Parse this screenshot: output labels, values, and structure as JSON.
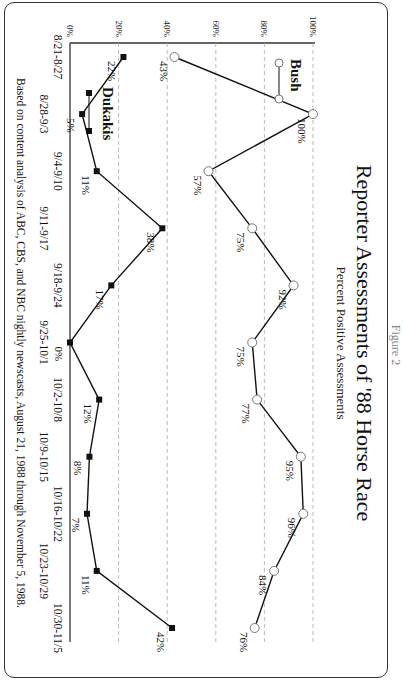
{
  "figure_label": "Figure 2",
  "chart_data": {
    "type": "line",
    "title": "Reporter Assessments of '88 Horse Race",
    "subtitle": "Percent Positive Assessments",
    "xlabel": "",
    "ylabel": "",
    "ylim": [
      0,
      100
    ],
    "yticks": [
      "0%",
      "20%",
      "40%",
      "60%",
      "80%",
      "100%"
    ],
    "grid": "dashed horizontal at 20% intervals",
    "legend_position": "upper-left inside plot",
    "categories": [
      "8/21-8/27",
      "8/28-9/3",
      "9/4-9/10",
      "9/11-9/17",
      "9/18-9/24",
      "9/25-10/1",
      "10/2-10/8",
      "10/9-10/15",
      "10/16-10/22",
      "10/23-10/29",
      "10/30-11/5"
    ],
    "series": [
      {
        "name": "Bush",
        "marker": "open-circle",
        "values": [
          43,
          100,
          57,
          75,
          92,
          75,
          77,
          95,
          96,
          84,
          76
        ]
      },
      {
        "name": "Dukakis",
        "marker": "filled-square",
        "values": [
          22,
          5,
          11,
          38,
          17,
          0,
          12,
          8,
          7,
          11,
          42
        ]
      }
    ],
    "footnote": "Based on content analysis of ABC, CBS, and NBC nightly newscasts, August 21, 1988 through November 5, 1988."
  }
}
